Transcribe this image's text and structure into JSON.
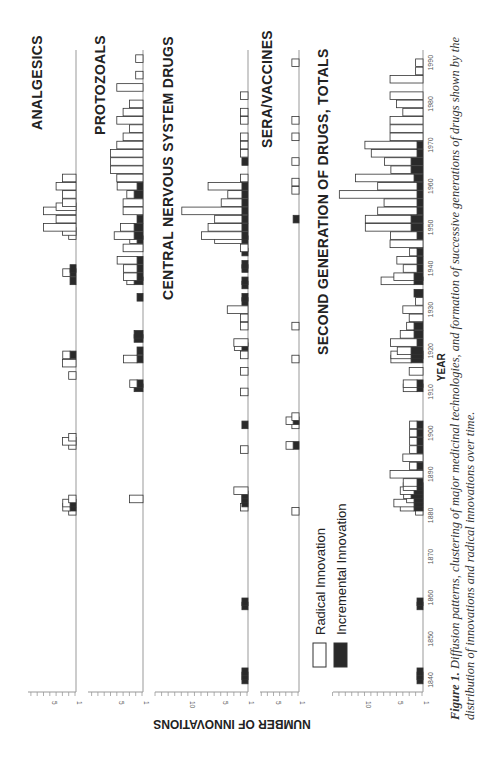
{
  "figure": {
    "caption_lead": "Figure 1.",
    "caption_text": "Diffusion patterns, clustering of major medicinal technologies, and formation of successive generations of drugs shown by the distribution of innovations and radical innovations over time.",
    "y_axis_label": "NUMBER OF INNOVATIONS",
    "x_axis_label": "YEAR",
    "legend": [
      {
        "label": "Radical Innovation",
        "fill": "#ffffff"
      },
      {
        "label": "Incremental Innovation",
        "fill": "#2a2a2a"
      }
    ],
    "colors": {
      "radical_fill": "#ffffff",
      "incremental_fill": "#2a2a2a",
      "stroke": "#333333",
      "axis": "#999999"
    }
  },
  "chart_data": [
    {
      "type": "bar",
      "title": "ANALGESICS",
      "xlabel": "YEAR",
      "ylabel": "NUMBER OF INNOVATIONS",
      "ylim": [
        0,
        8
      ],
      "y_ticks": [
        1,
        5
      ],
      "x": [
        1881,
        1882,
        1883,
        1884,
        1897,
        1898,
        1899,
        1914,
        1917,
        1919,
        1937,
        1939,
        1940,
        1948,
        1949,
        1950,
        1952,
        1954,
        1955,
        1956,
        1958,
        1960,
        1962
      ],
      "series": [
        {
          "name": "Incremental Innovation",
          "values": [
            0,
            1,
            1,
            0,
            0,
            0,
            0,
            0,
            0,
            1,
            1,
            1,
            1,
            0,
            0,
            0,
            0,
            0,
            0,
            0,
            0,
            0,
            0
          ]
        },
        {
          "name": "Radical Innovation",
          "values": [
            1,
            1,
            1,
            1,
            1,
            2,
            1,
            1,
            2,
            1,
            0,
            1,
            0,
            1,
            2,
            5,
            3,
            5,
            3,
            2,
            2,
            3,
            2
          ]
        }
      ]
    },
    {
      "type": "bar",
      "title": "PROTOZOALS",
      "xlabel": "YEAR",
      "ylabel": "NUMBER OF INNOVATIONS",
      "ylim": [
        0,
        8
      ],
      "y_ticks": [
        1,
        5
      ],
      "x": [
        1884,
        1911,
        1912,
        1918,
        1920,
        1923,
        1924,
        1933,
        1937,
        1938,
        1940,
        1942,
        1945,
        1947,
        1948,
        1950,
        1952,
        1954,
        1956,
        1958,
        1960,
        1962,
        1964,
        1966,
        1968,
        1970,
        1972,
        1974,
        1976,
        1978,
        1980,
        1984,
        1987,
        1991
      ],
      "series": [
        {
          "name": "Incremental Innovation",
          "values": [
            0,
            2,
            1,
            1,
            1,
            2,
            2,
            1,
            2,
            1,
            1,
            1,
            0,
            1,
            2,
            2,
            1,
            0,
            0,
            2,
            1,
            0,
            0,
            0,
            0,
            0,
            0,
            0,
            0,
            0,
            0,
            0,
            0,
            0
          ]
        },
        {
          "name": "Radical Innovation",
          "values": [
            2,
            0,
            1,
            2,
            0,
            0,
            0,
            0,
            1,
            2,
            2,
            3,
            3,
            1,
            3,
            2,
            0,
            3,
            3,
            1,
            3,
            4,
            5,
            5,
            5,
            4,
            3,
            2,
            4,
            3,
            2,
            4,
            1,
            1
          ]
        }
      ]
    },
    {
      "type": "bar",
      "title": "CENTRAL NERVOUS SYSTEM DRUGS",
      "xlabel": "YEAR",
      "ylabel": "NUMBER OF INNOVATIONS",
      "ylim": [
        0,
        15
      ],
      "y_ticks": [
        1,
        5,
        10
      ],
      "x": [
        1840,
        1841,
        1842,
        1858,
        1859,
        1882,
        1883,
        1884,
        1885,
        1886,
        1896,
        1902,
        1910,
        1915,
        1919,
        1921,
        1922,
        1926,
        1928,
        1930,
        1932,
        1933,
        1936,
        1937,
        1940,
        1941,
        1944,
        1945,
        1947,
        1948,
        1950,
        1952,
        1954,
        1956,
        1958,
        1960,
        1962,
        1966,
        1968,
        1970,
        1972,
        1976,
        1978,
        1982
      ],
      "series": [
        {
          "name": "Incremental Innovation",
          "values": [
            1,
            1,
            1,
            1,
            1,
            0,
            1,
            1,
            1,
            0,
            0,
            1,
            0,
            0,
            0,
            1,
            0,
            0,
            0,
            0,
            1,
            1,
            1,
            1,
            1,
            1,
            1,
            0,
            1,
            1,
            1,
            1,
            1,
            1,
            1,
            1,
            0,
            1,
            0,
            0,
            0,
            0,
            0,
            0
          ]
        },
        {
          "name": "Radical Innovation",
          "values": [
            0,
            0,
            0,
            0,
            0,
            1,
            0,
            0,
            0,
            2,
            1,
            0,
            1,
            1,
            1,
            1,
            2,
            1,
            1,
            3,
            0,
            0,
            0,
            0,
            0,
            0,
            0,
            1,
            4,
            6,
            5,
            4,
            9,
            3,
            2,
            5,
            1,
            0,
            1,
            1,
            1,
            1,
            1,
            1
          ]
        }
      ]
    },
    {
      "type": "bar",
      "title": "SERA/VACCINES",
      "xlabel": "YEAR",
      "ylabel": "NUMBER OF INNOVATIONS",
      "ylim": [
        0,
        8
      ],
      "y_ticks": [
        1,
        5
      ],
      "x": [
        1881,
        1897,
        1902,
        1903,
        1904,
        1918,
        1926,
        1952,
        1959,
        1961,
        1966,
        1972,
        1976,
        1990
      ],
      "series": [
        {
          "name": "Incremental Innovation",
          "values": [
            0,
            1,
            0,
            1,
            0,
            0,
            0,
            1,
            0,
            0,
            0,
            0,
            0,
            0
          ]
        },
        {
          "name": "Radical Innovation",
          "values": [
            1,
            1,
            1,
            1,
            1,
            1,
            1,
            0,
            1,
            1,
            1,
            1,
            1,
            1
          ]
        }
      ]
    },
    {
      "type": "bar",
      "title": "SECOND GENERATION OF DRUGS, TOTALS",
      "xlabel": "YEAR",
      "ylabel": "NUMBER OF INNOVATIONS",
      "ylim": [
        0,
        13
      ],
      "y_ticks": [
        1,
        5,
        10
      ],
      "x": [
        1840,
        1841,
        1842,
        1858,
        1859,
        1881,
        1882,
        1883,
        1884,
        1885,
        1886,
        1887,
        1888,
        1890,
        1892,
        1894,
        1896,
        1898,
        1900,
        1902,
        1911,
        1912,
        1915,
        1918,
        1919,
        1920,
        1922,
        1924,
        1926,
        1928,
        1930,
        1932,
        1934,
        1937,
        1938,
        1940,
        1942,
        1944,
        1946,
        1948,
        1950,
        1952,
        1954,
        1956,
        1958,
        1960,
        1962,
        1964,
        1966,
        1968,
        1970,
        1972,
        1974,
        1976,
        1978,
        1980,
        1982,
        1986,
        1988,
        1990
      ],
      "series": [
        {
          "name": "Incremental Innovation",
          "values": [
            1,
            1,
            1,
            1,
            1,
            0,
            2,
            2,
            2,
            3,
            2,
            1,
            1,
            0,
            1,
            0,
            1,
            1,
            1,
            1,
            1,
            1,
            0,
            3,
            3,
            3,
            1,
            2,
            2,
            0,
            0,
            0,
            2,
            2,
            2,
            1,
            1,
            1,
            0,
            1,
            3,
            3,
            1,
            1,
            1,
            1,
            2,
            3,
            3,
            1,
            1,
            0,
            0,
            0,
            0,
            0,
            0,
            0,
            0,
            0
          ]
        },
        {
          "name": "Radical Innovation",
          "values": [
            0,
            0,
            0,
            0,
            0,
            1,
            2,
            3,
            1,
            1,
            2,
            2,
            2,
            5,
            1,
            3,
            1,
            1,
            1,
            1,
            2,
            2,
            2,
            3,
            3,
            2,
            4,
            2,
            1,
            2,
            3,
            1,
            0,
            5,
            3,
            2,
            3,
            1,
            5,
            4,
            7,
            7,
            6,
            5,
            12,
            6,
            9,
            3,
            4,
            7,
            8,
            5,
            5,
            5,
            3,
            4,
            5,
            5,
            1,
            1
          ]
        }
      ]
    }
  ],
  "panels_layout": {
    "year_ticks": [
      1840,
      1850,
      1860,
      1870,
      1880,
      1890,
      1900,
      1910,
      1920,
      1930,
      1940,
      1950,
      1960,
      1970,
      1980,
      1990
    ]
  }
}
